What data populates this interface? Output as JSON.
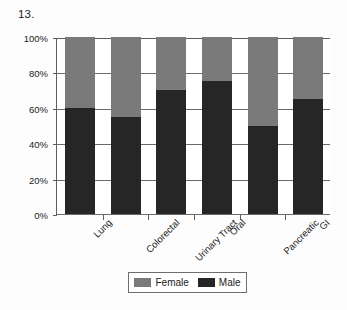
{
  "figure": {
    "number_label": "13."
  },
  "chart_data": {
    "type": "bar",
    "stacked": true,
    "stack_mode": "percent",
    "title": "",
    "xlabel": "",
    "ylabel": "",
    "ylim": [
      0,
      100
    ],
    "ytick_labels": [
      "0%",
      "20%",
      "40%",
      "60%",
      "80%",
      "100%"
    ],
    "ytick_values": [
      0,
      20,
      40,
      60,
      80,
      100
    ],
    "grid": true,
    "grid_axis": "y",
    "legend_position": "bottom",
    "categories": [
      "Lung",
      "Colorectal",
      "Urinary Tract",
      "Oral",
      "Pancreatic",
      "GI"
    ],
    "series": [
      {
        "name": "Male",
        "color": "#262626",
        "values": [
          60,
          55,
          70,
          75,
          50,
          65
        ]
      },
      {
        "name": "Female",
        "color": "#7a7a7a",
        "values": [
          40,
          45,
          30,
          25,
          50,
          35
        ]
      }
    ]
  },
  "legend": {
    "items": [
      {
        "label": "Female",
        "color": "#7a7a7a"
      },
      {
        "label": "Male",
        "color": "#262626"
      }
    ]
  },
  "colors": {
    "female": "#7a7a7a",
    "male": "#262626",
    "axis": "#5d5d5d",
    "grid": "#6b6b6b",
    "background": "#ffffff"
  }
}
